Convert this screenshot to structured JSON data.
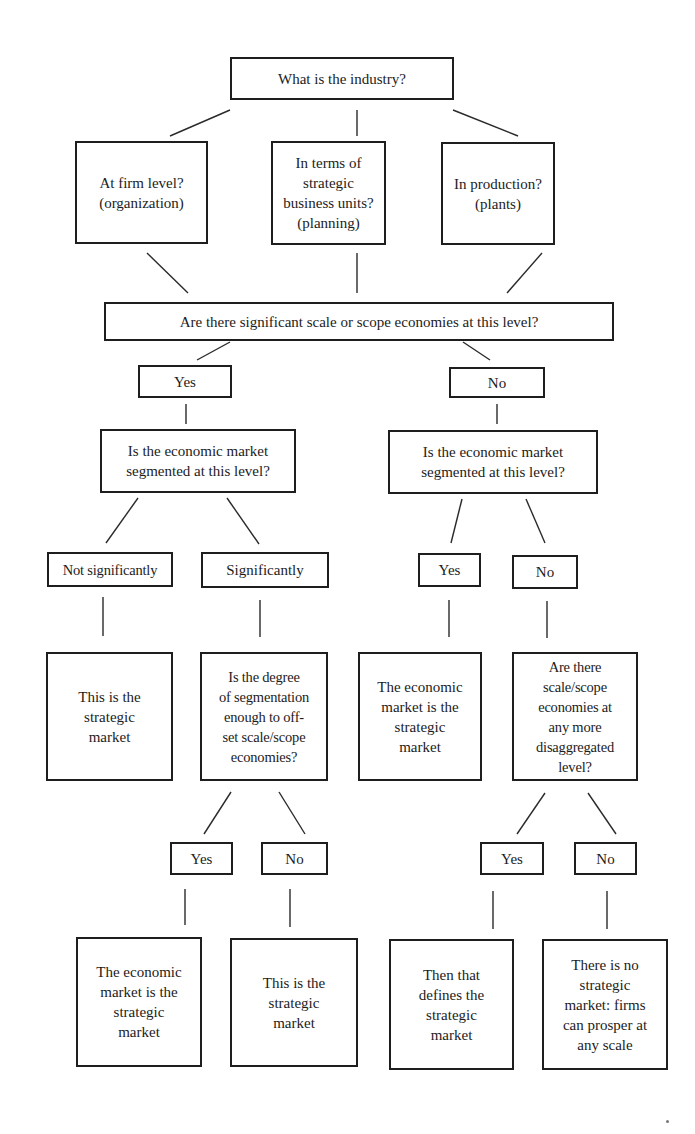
{
  "diagram": {
    "type": "decision-tree flowchart",
    "root": {
      "label": "What is the industry?"
    },
    "levels": [
      {
        "label": "At firm level?\n(organization)"
      },
      {
        "label": "In terms of\nstrategic\nbusiness units?\n(planning)"
      },
      {
        "label": "In production?\n(plants)"
      }
    ],
    "scale_question": {
      "label": "Are there significant scale or scope economies at this level?"
    },
    "scale_yes": {
      "label": "Yes"
    },
    "scale_no": {
      "label": "No"
    },
    "segmented_left": {
      "label": "Is the economic market\nsegmented at this level?"
    },
    "segmented_right": {
      "label": "Is the economic market\nsegmented at this level?"
    },
    "not_significantly": {
      "label": "Not significantly"
    },
    "significantly": {
      "label": "Significantly"
    },
    "seg_yes": {
      "label": "Yes"
    },
    "seg_no": {
      "label": "No"
    },
    "outcome_strategic_1": {
      "label": "This is the\nstrategic\nmarket"
    },
    "degree_question": {
      "label": "Is the degree\nof segmentation\nenough to off-\nset scale/scope\neconomies?"
    },
    "outcome_economic_1": {
      "label": "The economic\nmarket is the\nstrategic\nmarket"
    },
    "disaggregated_question": {
      "label": "Are there\nscale/scope\neconomies at\nany more\ndisaggregated\nlevel?"
    },
    "degree_yes": {
      "label": "Yes"
    },
    "degree_no": {
      "label": "No"
    },
    "disagg_yes": {
      "label": "Yes"
    },
    "disagg_no": {
      "label": "No"
    },
    "outcome_economic_2": {
      "label": "The economic\nmarket is the\nstrategic\nmarket"
    },
    "outcome_strategic_2": {
      "label": "This is the\nstrategic\nmarket"
    },
    "outcome_defines": {
      "label": "Then that\ndefines the\nstrategic\nmarket"
    },
    "outcome_none": {
      "label": "There is no\nstrategic\nmarket: firms\ncan prosper at\nany scale"
    }
  }
}
